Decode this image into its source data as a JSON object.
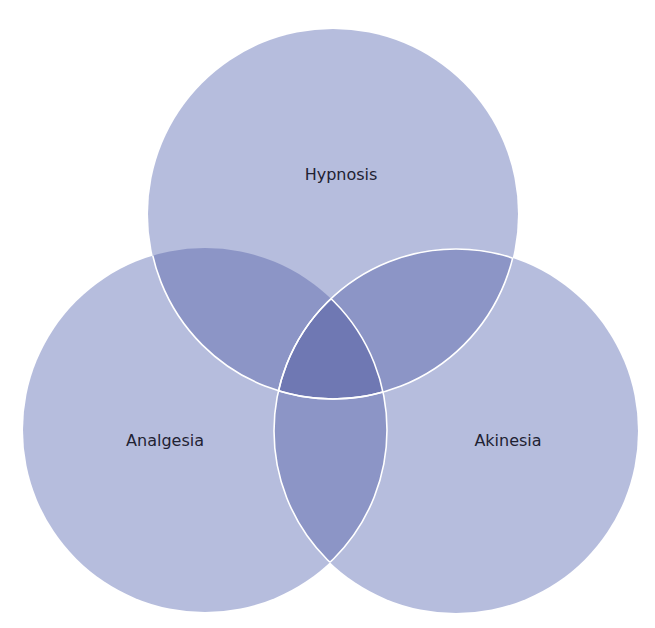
{
  "diagram": {
    "type": "venn-3",
    "colors": {
      "single": "#b6bddd",
      "double": "#8c95c6",
      "triple": "#6f78b3",
      "outline": "#ffffff",
      "text": "#1f2233"
    },
    "sets": [
      {
        "id": "hypnosis",
        "label": "Hypnosis",
        "cx": 333,
        "cy": 214,
        "r": 185,
        "label_x": 341,
        "label_y": 174
      },
      {
        "id": "analgesia",
        "label": "Analgesia",
        "cx": 205,
        "cy": 430,
        "r": 182,
        "label_x": 165,
        "label_y": 440
      },
      {
        "id": "akinesia",
        "label": "Akinesia",
        "cx": 456,
        "cy": 431,
        "r": 182,
        "label_x": 508,
        "label_y": 440
      }
    ]
  }
}
